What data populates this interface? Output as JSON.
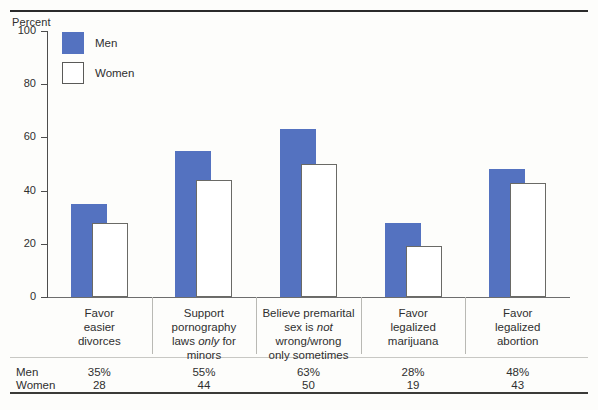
{
  "figure": {
    "axis_title": "Percent"
  },
  "legend": {
    "items": [
      {
        "label": "Men",
        "color": "#5472c0",
        "key": "men"
      },
      {
        "label": "Women",
        "color": "#ffffff",
        "key": "women"
      }
    ]
  },
  "table": {
    "row_labels": [
      "Men",
      "Women"
    ],
    "men_values": [
      "35%",
      "55%",
      "63%",
      "28%",
      "48%"
    ],
    "women_values": [
      "28",
      "44",
      "50",
      "19",
      "43"
    ]
  },
  "chart_data": {
    "type": "bar",
    "title": "",
    "xlabel": "",
    "ylabel": "Percent",
    "ylim": [
      0,
      100
    ],
    "yticks": [
      0,
      20,
      40,
      60,
      80,
      100
    ],
    "ytick_labels": [
      "0",
      "20",
      "40",
      "60",
      "80",
      "100"
    ],
    "grid": false,
    "legend_position": "top-left-inside",
    "categories": [
      "Favor easier divorces",
      "Support pornography laws only for minors",
      "Believe premarital sex is not wrong/wrong only sometimes",
      "Favor legalized marijuana",
      "Favor legalized abortion"
    ],
    "category_lines": [
      [
        {
          "t": "Favor",
          "i": false
        },
        {
          "t": "easier",
          "i": false
        },
        {
          "t": "divorces",
          "i": false
        }
      ],
      [
        {
          "t": "Support",
          "i": false
        },
        {
          "t": "pornography",
          "i": false
        },
        {
          "t": "laws ",
          "i": false,
          "em": "only",
          "after": " for"
        },
        {
          "t": "minors",
          "i": false
        }
      ],
      [
        {
          "t": "Believe premarital",
          "i": false
        },
        {
          "t": "sex is ",
          "i": false,
          "em": "not",
          "after": ""
        },
        {
          "t": "wrong/wrong",
          "i": false
        },
        {
          "t": "only sometimes",
          "i": false
        }
      ],
      [
        {
          "t": "Favor",
          "i": false
        },
        {
          "t": "legalized",
          "i": false
        },
        {
          "t": "marijuana",
          "i": false
        }
      ],
      [
        {
          "t": "Favor",
          "i": false
        },
        {
          "t": "legalized",
          "i": false
        },
        {
          "t": "abortion",
          "i": false
        }
      ]
    ],
    "series": [
      {
        "name": "Men",
        "color": "#5472c0",
        "values": [
          35,
          55,
          63,
          28,
          48
        ]
      },
      {
        "name": "Women",
        "color": "#ffffff",
        "values": [
          28,
          44,
          50,
          19,
          43
        ]
      }
    ]
  }
}
